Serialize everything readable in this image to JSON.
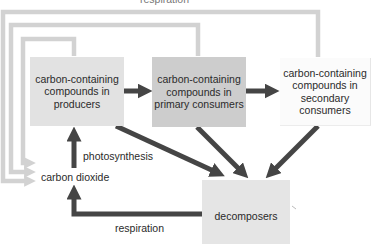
{
  "diagram": {
    "nodes": {
      "producers": "carbon-containing compounds in producers",
      "primary": "carbon-containing compounds in primary consumers",
      "secondary": "carbon-containing compounds in secondary consumers",
      "carbon_dioxide": "carbon dioxide",
      "decomposers": "decomposers"
    },
    "edge_labels": {
      "top_respiration": "respiration",
      "photosynthesis": "photosynthesis",
      "bottom_respiration": "respiration"
    },
    "edges": [
      {
        "from": "producers",
        "to": "primary",
        "style": "dark"
      },
      {
        "from": "primary",
        "to": "secondary",
        "style": "dark"
      },
      {
        "from": "carbon_dioxide",
        "to": "producers",
        "label": "photosynthesis",
        "style": "dark"
      },
      {
        "from": "producers",
        "to": "decomposers",
        "style": "dark"
      },
      {
        "from": "primary",
        "to": "decomposers",
        "style": "dark"
      },
      {
        "from": "secondary",
        "to": "decomposers",
        "style": "dark"
      },
      {
        "from": "decomposers",
        "to": "carbon_dioxide",
        "label": "respiration",
        "style": "dark"
      },
      {
        "from": "producers",
        "to": "carbon_dioxide",
        "label": "respiration",
        "style": "light"
      },
      {
        "from": "primary",
        "to": "carbon_dioxide",
        "label": "respiration",
        "style": "light"
      },
      {
        "from": "secondary",
        "to": "carbon_dioxide",
        "label": "respiration",
        "style": "light"
      }
    ],
    "colors": {
      "dark_arrow": "#454545",
      "light_arrow": "#d2d2d2",
      "producers_fill": "#e2e2e2",
      "primary_fill": "#cdcdcd",
      "secondary_fill": "#fbfbfb",
      "decomposers_fill": "#e5e5e5"
    }
  }
}
